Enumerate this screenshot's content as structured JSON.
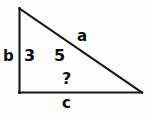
{
  "diagram": {
    "background_color": "#fdfdfd",
    "stroke_color": "#161616",
    "text_color": "#0d0d0d",
    "vertices": {
      "apex": [
        19,
        8
      ],
      "bottom_left": [
        19,
        93
      ],
      "bottom_right": [
        142,
        93
      ]
    },
    "sides": [
      {
        "name": "vertical-leg",
        "label": "b",
        "from": "apex",
        "to": "bottom_left"
      },
      {
        "name": "base-leg",
        "label": "c",
        "from": "bottom_left",
        "to": "bottom_right"
      },
      {
        "name": "hypotenuse",
        "label": "a",
        "from": "apex",
        "to": "bottom_right"
      }
    ],
    "labels": {
      "side_b": "b",
      "side_a": "a",
      "side_c": "c",
      "value_3": "3",
      "value_5": "5",
      "unknown": "?"
    }
  }
}
